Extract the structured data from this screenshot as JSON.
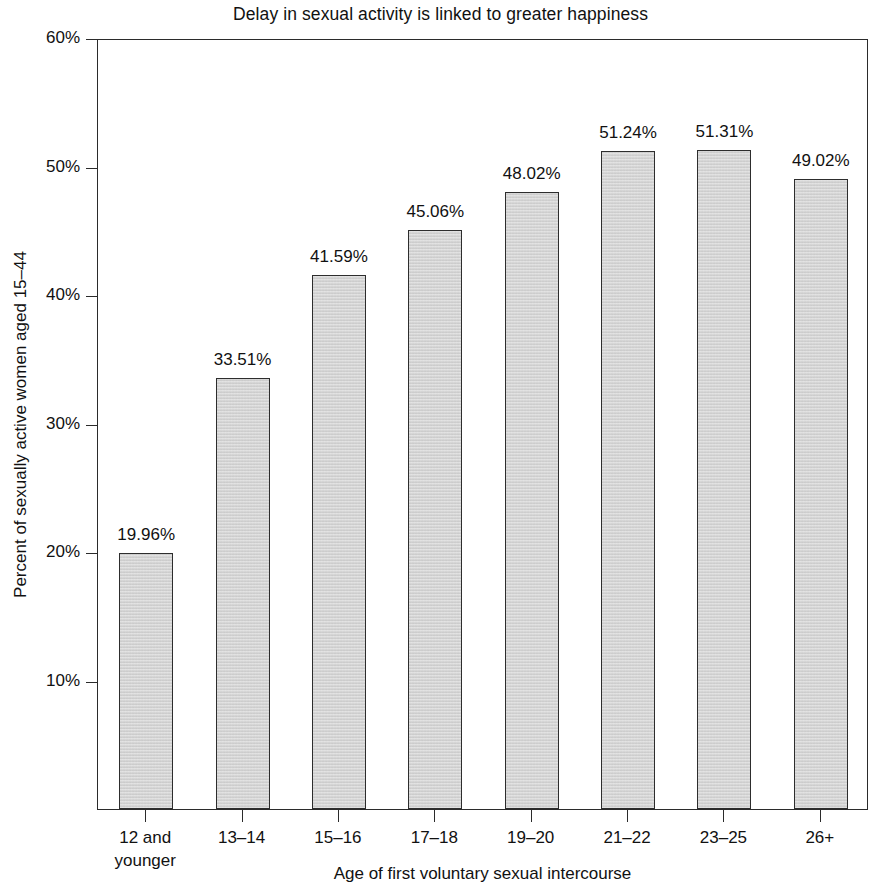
{
  "chart_data": {
    "type": "bar",
    "title": "Delay in sexual activity is linked to greater happiness",
    "xlabel": "Age of first voluntary sexual intercourse",
    "ylabel": "Percent of sexually active women aged 15–44",
    "categories": [
      "12 and\nyounger",
      "13–14",
      "15–16",
      "17–18",
      "19–20",
      "21–22",
      "23–25",
      "26+"
    ],
    "values": [
      19.96,
      33.51,
      41.59,
      45.06,
      48.02,
      51.24,
      51.31,
      49.02
    ],
    "value_labels": [
      "19.96%",
      "33.51%",
      "41.59%",
      "45.06%",
      "48.02%",
      "51.24%",
      "51.31%",
      "49.02%"
    ],
    "ylim": [
      0,
      60
    ],
    "ytick_values": [
      10,
      20,
      30,
      40,
      50,
      60
    ],
    "ytick_labels": [
      "10%",
      "20%",
      "30%",
      "40%",
      "50%",
      "60%"
    ],
    "grid": false,
    "legend": null,
    "bar_fill_color": "#d0d0d0",
    "bar_border_color": "#2d2d2d",
    "axis_color": "#2b2b2b",
    "background_color": "#ffffff"
  }
}
